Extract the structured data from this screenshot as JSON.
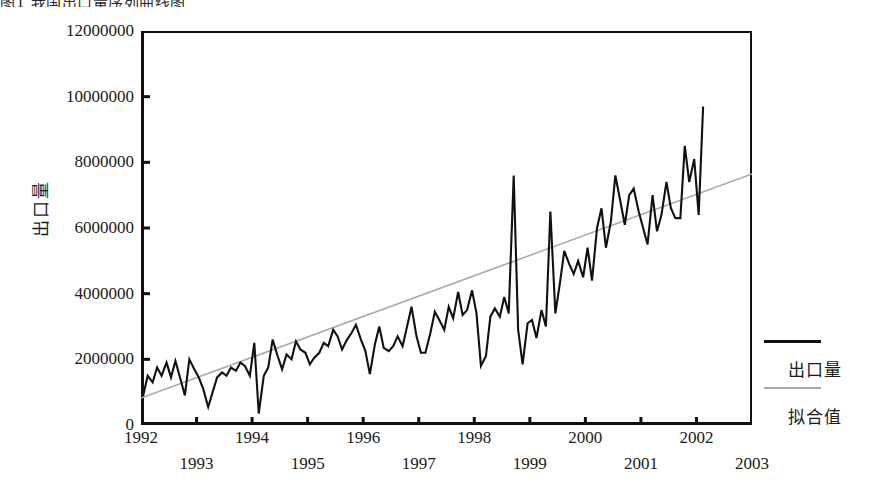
{
  "figure": {
    "top_caption": "图1 我国出口量序列曲线图",
    "background_color": "#ffffff"
  },
  "legend": {
    "position": "right",
    "entries": [
      {
        "label": "出口量",
        "color": "#111111",
        "style": "solid-thick"
      },
      {
        "label": "拟合值",
        "color": "#a8a8a8",
        "style": "solid-thin"
      }
    ]
  },
  "chart_data": {
    "type": "line",
    "title": "",
    "subtitle": "",
    "xlabel": "",
    "ylabel": "出口量",
    "grid": false,
    "legend_position": "right",
    "xlim": [
      1992.0,
      2003.0
    ],
    "ylim": [
      0,
      12000000
    ],
    "y_ticks": [
      0,
      2000000,
      4000000,
      6000000,
      8000000,
      10000000,
      12000000
    ],
    "y_tick_labels": [
      "0",
      "2000000",
      "4000000",
      "6000000",
      "8000000",
      "10000000",
      "12000000"
    ],
    "x_ticks": [
      1992,
      1993,
      1994,
      1995,
      1996,
      1997,
      1998,
      1999,
      2000,
      2001,
      2002,
      2003
    ],
    "x_tick_labels": [
      "1992",
      "1993",
      "1994",
      "1995",
      "1996",
      "1997",
      "1998",
      "1999",
      "2000",
      "2001",
      "2002",
      "2003"
    ],
    "x_tick_rows": [
      0,
      1,
      0,
      1,
      0,
      1,
      0,
      1,
      0,
      1,
      0,
      1
    ],
    "series": [
      {
        "name": "出口量",
        "color": "#111111",
        "x": [
          1992.04,
          1992.12,
          1992.21,
          1992.29,
          1992.37,
          1992.46,
          1992.54,
          1992.62,
          1992.71,
          1992.79,
          1992.87,
          1992.96,
          1993.04,
          1993.12,
          1993.21,
          1993.29,
          1993.37,
          1993.46,
          1993.54,
          1993.62,
          1993.71,
          1993.79,
          1993.87,
          1993.96,
          1994.04,
          1994.12,
          1994.21,
          1994.29,
          1994.37,
          1994.46,
          1994.54,
          1994.62,
          1994.71,
          1994.79,
          1994.87,
          1994.96,
          1995.04,
          1995.12,
          1995.21,
          1995.29,
          1995.37,
          1995.46,
          1995.54,
          1995.62,
          1995.71,
          1995.79,
          1995.87,
          1995.96,
          1996.04,
          1996.12,
          1996.21,
          1996.29,
          1996.37,
          1996.46,
          1996.54,
          1996.62,
          1996.71,
          1996.79,
          1996.87,
          1996.96,
          1997.04,
          1997.12,
          1997.21,
          1997.29,
          1997.37,
          1997.46,
          1997.54,
          1997.62,
          1997.71,
          1997.79,
          1997.87,
          1997.96,
          1998.04,
          1998.12,
          1998.21,
          1998.29,
          1998.37,
          1998.46,
          1998.54,
          1998.62,
          1998.71,
          1998.79,
          1998.87,
          1998.96,
          1999.04,
          1999.12,
          1999.21,
          1999.29,
          1999.37,
          1999.46,
          1999.54,
          1999.62,
          1999.71,
          1999.79,
          1999.87,
          1999.96,
          2000.04,
          2000.12,
          2000.21,
          2000.29,
          2000.37,
          2000.46,
          2000.54,
          2000.62,
          2000.71,
          2000.79,
          2000.87,
          2000.96,
          2001.04,
          2001.12,
          2001.21,
          2001.29,
          2001.37,
          2001.46,
          2001.54,
          2001.62,
          2001.71,
          2001.79,
          2001.87,
          2001.96,
          2002.04,
          2002.12
        ],
        "values": [
          900000,
          1500000,
          1300000,
          1750000,
          1500000,
          1900000,
          1450000,
          1950000,
          1400000,
          900000,
          2000000,
          1700000,
          1450000,
          1100000,
          550000,
          1000000,
          1450000,
          1600000,
          1500000,
          1750000,
          1650000,
          1900000,
          1800000,
          1500000,
          2500000,
          350000,
          1500000,
          1750000,
          2600000,
          2100000,
          1700000,
          2150000,
          2000000,
          2550000,
          2300000,
          2200000,
          1850000,
          2050000,
          2200000,
          2500000,
          2400000,
          2900000,
          2700000,
          2300000,
          2600000,
          2800000,
          3050000,
          2600000,
          2250000,
          1550000,
          2450000,
          3000000,
          2350000,
          2250000,
          2400000,
          2700000,
          2400000,
          3000000,
          3600000,
          2700000,
          2200000,
          2200000,
          2800000,
          3450000,
          3200000,
          2900000,
          3600000,
          3250000,
          4050000,
          3350000,
          3500000,
          4100000,
          3400000,
          1800000,
          2100000,
          3300000,
          3550000,
          3300000,
          3900000,
          3400000,
          7600000,
          2900000,
          1850000,
          3100000,
          3200000,
          2650000,
          3500000,
          3000000,
          6500000,
          3400000,
          4300000,
          5300000,
          4900000,
          4600000,
          5000000,
          4500000,
          5400000,
          4400000,
          6000000,
          6600000,
          5400000,
          6200000,
          7600000,
          6900000,
          6100000,
          7000000,
          7200000,
          6500000,
          6000000,
          5500000,
          7000000,
          5900000,
          6400000,
          7400000,
          6600000,
          6300000,
          6300000,
          8500000,
          7400000,
          8100000,
          6400000,
          9700000
        ]
      },
      {
        "name": "拟合值",
        "color": "#a8a8a8",
        "x": [
          1992.0,
          2003.0
        ],
        "values": [
          820000,
          7650000
        ],
        "fit_type": "linear"
      }
    ]
  }
}
